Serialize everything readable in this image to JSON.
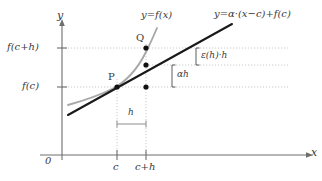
{
  "figure": {
    "background_color": "#ffffff",
    "ink_color": "#3a3a3a",
    "curve_color": "#a8a8a8",
    "line_color": "#1a1a1a",
    "grid_color": "#bdbdbd"
  },
  "axes": {
    "x_label": "x",
    "y_label": "y",
    "origin_label": "0",
    "x_ticks": [
      {
        "label": "c",
        "x": 117
      },
      {
        "label": "c+h",
        "x": 146
      }
    ],
    "y_ticks": [
      {
        "label": "f(c+h)",
        "y": 48
      },
      {
        "label": "f(c)",
        "y": 87
      }
    ]
  },
  "curves": [
    {
      "name": "function-curve",
      "label": "y=f(x)",
      "color": "#a8a8a8"
    },
    {
      "name": "tangent-line",
      "label": "y=α·(x−c)+f(c)",
      "color": "#1a1a1a"
    }
  ],
  "points": [
    {
      "name": "point-P",
      "label": "P",
      "x": 117,
      "y": 87
    },
    {
      "name": "point-Q",
      "label": "Q",
      "x": 146,
      "y": 48
    },
    {
      "name": "point-tangent-at-c-plus-h",
      "label": "",
      "x": 146,
      "y": 65
    },
    {
      "name": "point-base-at-c-plus-h",
      "label": "",
      "x": 146,
      "y": 87
    }
  ],
  "annotations": {
    "h_bracket": "h",
    "alpha_h_bracket": "αh",
    "epsilon_bracket": "ε(h)·h"
  }
}
